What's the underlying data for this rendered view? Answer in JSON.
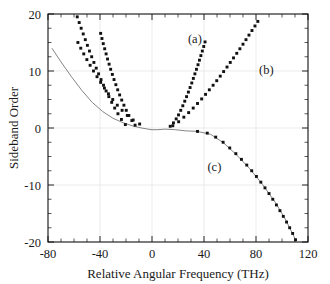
{
  "chart_data": {
    "type": "scatter",
    "title": "",
    "xlabel": "Relative Angular Frequency (THz)",
    "ylabel": "Sideband Order",
    "xlim": [
      -80,
      120
    ],
    "ylim": [
      -20,
      20
    ],
    "xticks": [
      -80,
      -40,
      0,
      40,
      80,
      120
    ],
    "xtick_labels": [
      "-80",
      "-40",
      "0",
      "40",
      "80",
      "120"
    ],
    "yticks": [
      20,
      10,
      0,
      -10,
      -20
    ],
    "ytick_labels": [
      "20",
      "10",
      "0",
      "-10",
      "-20"
    ],
    "x_minor_tick_step": 10,
    "y_minor_tick_step": 2.5,
    "grid": "faint-major",
    "legend_position": "inline-annotations",
    "marker": "filled-square",
    "annotations": [
      {
        "text": "(a)",
        "x": 33,
        "y": 15.0
      },
      {
        "text": "(b)",
        "x": 88,
        "y": 9.5
      },
      {
        "text": "(c)",
        "x": 48,
        "y": -7.6
      }
    ],
    "series": [
      {
        "name": "(a)",
        "label": "(a)",
        "branch": "right",
        "points": [
          [
            14.0,
            0.3
          ],
          [
            16.5,
            0.9
          ],
          [
            18.6,
            1.6
          ],
          [
            20.4,
            2.3
          ],
          [
            22.1,
            3.1
          ],
          [
            23.7,
            3.9
          ],
          [
            25.2,
            4.7
          ],
          [
            26.6,
            5.5
          ],
          [
            28.0,
            6.3
          ],
          [
            29.3,
            7.1
          ],
          [
            30.6,
            7.9
          ],
          [
            31.8,
            8.7
          ],
          [
            33.0,
            9.5
          ],
          [
            34.2,
            10.3
          ],
          [
            35.4,
            11.1
          ],
          [
            36.5,
            11.9
          ],
          [
            37.6,
            12.7
          ],
          [
            38.7,
            13.5
          ],
          [
            39.8,
            14.3
          ],
          [
            40.8,
            15.1
          ]
        ]
      },
      {
        "name": "(a)-left",
        "label": "(a)",
        "branch": "left",
        "points": [
          [
            -13.0,
            0.5
          ],
          [
            -15.5,
            1.3
          ],
          [
            -17.8,
            2.2
          ],
          [
            -19.8,
            3.1
          ],
          [
            -21.6,
            4.0
          ],
          [
            -23.3,
            4.9
          ],
          [
            -24.9,
            5.8
          ],
          [
            -26.4,
            6.7
          ],
          [
            -27.8,
            7.6
          ],
          [
            -29.2,
            8.5
          ],
          [
            -30.5,
            9.4
          ],
          [
            -31.8,
            10.3
          ],
          [
            -33.0,
            11.2
          ],
          [
            -34.2,
            12.1
          ],
          [
            -35.3,
            13.0
          ],
          [
            -36.4,
            13.9
          ],
          [
            -37.5,
            14.8
          ],
          [
            -38.5,
            15.7
          ],
          [
            -39.5,
            16.6
          ]
        ]
      },
      {
        "name": "(b)",
        "label": "(b)",
        "branch": "right",
        "points": [
          [
            16.0,
            0.4
          ],
          [
            20.5,
            1.1
          ],
          [
            24.5,
            1.9
          ],
          [
            28.2,
            2.7
          ],
          [
            31.7,
            3.5
          ],
          [
            35.0,
            4.3
          ],
          [
            38.2,
            5.1
          ],
          [
            41.2,
            5.9
          ],
          [
            44.1,
            6.7
          ],
          [
            47.0,
            7.5
          ],
          [
            49.8,
            8.3
          ],
          [
            52.5,
            9.1
          ],
          [
            55.1,
            9.9
          ],
          [
            57.7,
            10.7
          ],
          [
            60.2,
            11.5
          ],
          [
            62.7,
            12.3
          ],
          [
            65.2,
            13.1
          ],
          [
            67.6,
            13.9
          ],
          [
            70.0,
            14.7
          ],
          [
            72.3,
            15.5
          ],
          [
            74.6,
            16.3
          ],
          [
            76.9,
            17.1
          ],
          [
            79.2,
            17.9
          ],
          [
            81.4,
            18.7
          ]
        ]
      },
      {
        "name": "(b)-left",
        "label": "(b)",
        "branch": "left",
        "points": [
          [
            -20.5,
            0.6
          ],
          [
            -23.5,
            1.5
          ],
          [
            -26.2,
            2.5
          ],
          [
            -28.7,
            3.5
          ],
          [
            -31.0,
            4.5
          ],
          [
            -33.2,
            5.5
          ],
          [
            -35.3,
            6.5
          ],
          [
            -37.3,
            7.5
          ],
          [
            -39.2,
            8.5
          ],
          [
            -41.1,
            9.5
          ],
          [
            -42.9,
            10.5
          ],
          [
            -44.7,
            11.5
          ],
          [
            -46.4,
            12.5
          ],
          [
            -48.1,
            13.5
          ],
          [
            -49.7,
            14.5
          ],
          [
            -51.3,
            15.5
          ],
          [
            -52.9,
            16.5
          ],
          [
            -54.5,
            17.5
          ],
          [
            -56.0,
            18.5
          ],
          [
            -57.5,
            19.5
          ]
        ]
      },
      {
        "name": "(c)",
        "label": "(c)",
        "branch": "right",
        "points": [
          [
            35.0,
            -0.6
          ],
          [
            42.5,
            -0.9
          ],
          [
            49.0,
            -1.6
          ],
          [
            54.7,
            -2.5
          ],
          [
            59.8,
            -3.5
          ],
          [
            64.5,
            -4.5
          ],
          [
            68.8,
            -5.5
          ],
          [
            72.9,
            -6.5
          ],
          [
            76.7,
            -7.5
          ],
          [
            80.3,
            -8.5
          ],
          [
            83.7,
            -9.5
          ],
          [
            86.9,
            -10.5
          ],
          [
            90.0,
            -11.5
          ],
          [
            92.9,
            -12.5
          ],
          [
            95.7,
            -13.5
          ],
          [
            98.4,
            -14.5
          ],
          [
            101.0,
            -15.5
          ],
          [
            103.5,
            -16.5
          ],
          [
            105.9,
            -17.5
          ],
          [
            108.2,
            -18.5
          ],
          [
            110.4,
            -19.6
          ]
        ]
      },
      {
        "name": "(c)-left",
        "label": "(c)",
        "branch": "left",
        "points": [
          [
            -9.5,
            0.7
          ],
          [
            -14.5,
            1.4
          ],
          [
            -19.0,
            2.2
          ],
          [
            -23.0,
            3.1
          ],
          [
            -26.7,
            4.0
          ],
          [
            -30.2,
            5.0
          ],
          [
            -33.5,
            6.0
          ],
          [
            -36.6,
            7.0
          ],
          [
            -39.5,
            8.0
          ],
          [
            -42.3,
            9.0
          ],
          [
            -45.0,
            10.0
          ],
          [
            -47.6,
            11.0
          ],
          [
            -50.1,
            12.0
          ],
          [
            -52.5,
            13.0
          ],
          [
            -54.8,
            14.0
          ],
          [
            -57.0,
            15.0
          ]
        ]
      },
      {
        "name": "guide-curve",
        "label": "",
        "branch": "through",
        "points": [
          [
            -77.0,
            14.0
          ],
          [
            -70.0,
            11.6
          ],
          [
            -62.0,
            9.0
          ],
          [
            -54.0,
            6.6
          ],
          [
            -46.0,
            4.5
          ],
          [
            -38.0,
            2.9
          ],
          [
            -30.0,
            1.7
          ],
          [
            -22.0,
            0.9
          ],
          [
            -14.0,
            0.3
          ],
          [
            -8.0,
            0.0
          ],
          [
            -3.0,
            -0.2
          ],
          [
            0.0,
            -0.3
          ],
          [
            4.0,
            -0.3
          ],
          [
            10.0,
            -0.2
          ],
          [
            18.0,
            -0.3
          ],
          [
            26.0,
            -0.5
          ],
          [
            35.0,
            -0.6
          ],
          [
            45.0,
            -1.1
          ],
          [
            55.0,
            -2.6
          ],
          [
            65.0,
            -4.7
          ],
          [
            75.0,
            -7.1
          ],
          [
            85.0,
            -9.9
          ],
          [
            95.0,
            -13.1
          ],
          [
            103.0,
            -16.2
          ],
          [
            110.4,
            -19.6
          ]
        ]
      }
    ]
  }
}
